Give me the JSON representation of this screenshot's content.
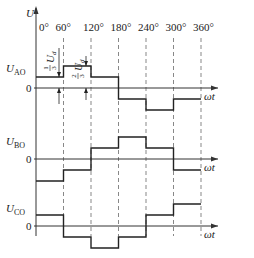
{
  "diagram": {
    "title_axis_label": "U",
    "angle_ticks": [
      "0°",
      "60°",
      "120°",
      "180°",
      "240°",
      "300°",
      "360°"
    ],
    "time_axis_label": "ωt",
    "zero_label": "0",
    "annotations": {
      "one_third": {
        "num": "1",
        "den": "3",
        "var": "U",
        "sub": "d"
      },
      "two_thirds": {
        "num": "2",
        "den": "3",
        "var": "U",
        "sub": "d"
      }
    },
    "unit": "Ud",
    "waveforms": [
      {
        "name": "U",
        "sub": "AO",
        "levels": [
          0.3333,
          0.6667,
          0.3333,
          -0.3333,
          -0.6667,
          -0.3333
        ]
      },
      {
        "name": "U",
        "sub": "BO",
        "levels": [
          -0.6667,
          -0.3333,
          0.3333,
          0.6667,
          0.3333,
          -0.3333
        ]
      },
      {
        "name": "U",
        "sub": "CO",
        "levels": [
          0.3333,
          -0.3333,
          -0.6667,
          -0.3333,
          0.3333,
          0.6667
        ]
      }
    ]
  }
}
